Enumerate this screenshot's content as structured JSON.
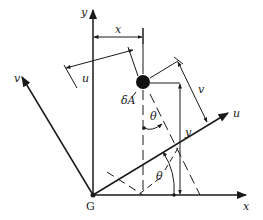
{
  "diagram": {
    "origin_label": "G",
    "axes": {
      "x_label": "x",
      "y_label": "y",
      "u_label": "u",
      "v_label": "v"
    },
    "element_label": "δA",
    "angle_label_top": "θ",
    "angle_label_bottom": "θ",
    "dimensions": {
      "x_label": "x",
      "y_label": "y",
      "u_label": "u",
      "v_label": "v"
    },
    "colors": {
      "stroke": "#1a1a1a",
      "background": "#ffffff"
    }
  }
}
